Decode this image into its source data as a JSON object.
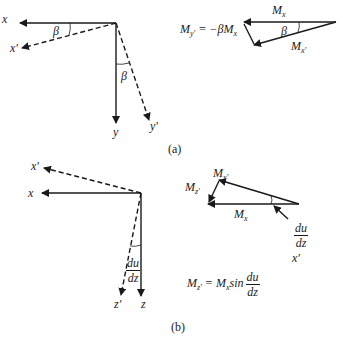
{
  "panel_a": {
    "caption": "(a)",
    "axes": {
      "x": "x",
      "x_prime": "x'",
      "y": "y",
      "y_prime": "y'",
      "angle_top": "β",
      "angle_side": "β"
    },
    "vector_diagram": {
      "mx_label": "M",
      "mx_sub": "x",
      "mxp_label": "M",
      "mxp_sub": "x'",
      "angle": "β",
      "equation_lhs": "M",
      "equation_lhs_sub": "y'",
      "equation_rhs": " = −βM",
      "equation_rhs_sub": "x"
    }
  },
  "panel_b": {
    "caption": "(b)",
    "axes": {
      "x": "x",
      "x_prime": "x'",
      "z": "z",
      "z_prime": "z'",
      "angle_num": "du",
      "angle_den": "dz"
    },
    "vector_diagram": {
      "mxp_label": "M",
      "mxp_sub": "x'",
      "mzp_label": "M",
      "mzp_sub": "z'",
      "mx_label": "M",
      "mx_sub": "x",
      "angle_num": "du",
      "angle_den": "dz",
      "xprime_label": "x'",
      "equation_lhs": "M",
      "equation_lhs_sub": "z'",
      "equation_mid": " = M",
      "equation_mid_sub": "x",
      "equation_sin": "sin",
      "equation_num": "du",
      "equation_den": "dz"
    }
  }
}
